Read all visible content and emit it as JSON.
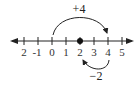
{
  "diagram": {
    "type": "number-line",
    "ticks": [
      {
        "value": -2,
        "label": "2",
        "x": 24
      },
      {
        "value": -1,
        "label": "-1",
        "x": 38
      },
      {
        "value": 0,
        "label": "0",
        "x": 52
      },
      {
        "value": 1,
        "label": "1",
        "x": 66
      },
      {
        "value": 2,
        "label": "2",
        "x": 80
      },
      {
        "value": 3,
        "label": "3",
        "x": 94
      },
      {
        "value": 4,
        "label": "4",
        "x": 108
      },
      {
        "value": 5,
        "label": "5",
        "x": 122
      }
    ],
    "point": {
      "value": 2,
      "x": 80
    },
    "jumps": [
      {
        "label": "+4",
        "from": 0,
        "to": 4
      },
      {
        "label": "−2",
        "from": 4,
        "to": 2
      }
    ],
    "colors": {
      "line": "#222222",
      "text": "#333333"
    }
  }
}
